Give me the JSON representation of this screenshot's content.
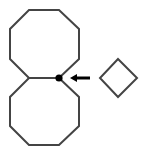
{
  "diagram": {
    "colors": {
      "background": "#ffffff",
      "stroke": "#444444",
      "dot": "#000000",
      "arrow": "#000000"
    },
    "shapes": {
      "top_octagon": {
        "points": "29,10 59,10 79,29 79,59 59,78 29,78 10,59 10,29"
      },
      "bottom_octagon": {
        "points": "29,78 59,78 79,97 79,126 59,145 29,145 10,126 10,97"
      },
      "diamond": {
        "points": "118,59 137,78 118,97 100,78"
      },
      "marked_vertex": {
        "cx": 59,
        "cy": 78,
        "r": 3.6
      },
      "arrow": {
        "x1": 90,
        "y1": 78,
        "x2": 76,
        "y2": 78,
        "head": "70,78 77,74 77,82"
      }
    }
  }
}
